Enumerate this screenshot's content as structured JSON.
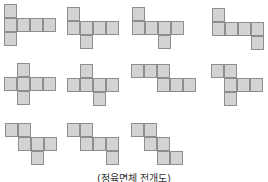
{
  "caption": "(정육면체 전개도)",
  "colors": {
    "fill": "#d3d3d3",
    "stroke": "#8e8e8e",
    "background": "#ffffff"
  },
  "nets": [
    {
      "id": 1,
      "cells": [
        [
          0,
          0
        ],
        [
          0,
          1
        ],
        [
          1,
          1
        ],
        [
          2,
          1
        ],
        [
          3,
          1
        ],
        [
          0,
          2
        ]
      ]
    },
    {
      "id": 2,
      "cells": [
        [
          0,
          0
        ],
        [
          0,
          1
        ],
        [
          1,
          1
        ],
        [
          2,
          1
        ],
        [
          3,
          1
        ],
        [
          1,
          2
        ]
      ]
    },
    {
      "id": 3,
      "cells": [
        [
          0,
          0
        ],
        [
          0,
          1
        ],
        [
          1,
          1
        ],
        [
          2,
          1
        ],
        [
          3,
          1
        ],
        [
          2,
          2
        ]
      ]
    },
    {
      "id": 4,
      "cells": [
        [
          0,
          0
        ],
        [
          0,
          1
        ],
        [
          1,
          1
        ],
        [
          2,
          1
        ],
        [
          3,
          1
        ],
        [
          3,
          2
        ]
      ]
    },
    {
      "id": 5,
      "cells": [
        [
          1,
          0
        ],
        [
          0,
          1
        ],
        [
          1,
          1
        ],
        [
          2,
          1
        ],
        [
          3,
          1
        ],
        [
          1,
          2
        ]
      ]
    },
    {
      "id": 6,
      "cells": [
        [
          1,
          0
        ],
        [
          0,
          1
        ],
        [
          1,
          1
        ],
        [
          2,
          1
        ],
        [
          3,
          1
        ],
        [
          2,
          2
        ]
      ]
    },
    {
      "id": 7,
      "cells": [
        [
          0,
          0
        ],
        [
          1,
          0
        ],
        [
          2,
          0
        ],
        [
          2,
          1
        ],
        [
          3,
          1
        ],
        [
          4,
          1
        ]
      ]
    },
    {
      "id": 8,
      "cells": [
        [
          0,
          0
        ],
        [
          1,
          0
        ],
        [
          1,
          1
        ],
        [
          2,
          1
        ],
        [
          3,
          1
        ],
        [
          1,
          2
        ]
      ]
    },
    {
      "id": 9,
      "cells": [
        [
          0,
          0
        ],
        [
          1,
          0
        ],
        [
          1,
          1
        ],
        [
          2,
          1
        ],
        [
          3,
          1
        ],
        [
          2,
          2
        ]
      ]
    },
    {
      "id": 10,
      "cells": [
        [
          0,
          0
        ],
        [
          1,
          0
        ],
        [
          1,
          1
        ],
        [
          2,
          1
        ],
        [
          3,
          1
        ],
        [
          3,
          2
        ]
      ]
    },
    {
      "id": 11,
      "cells": [
        [
          0,
          0
        ],
        [
          1,
          0
        ],
        [
          1,
          1
        ],
        [
          2,
          1
        ],
        [
          2,
          2
        ],
        [
          3,
          2
        ]
      ]
    }
  ]
}
